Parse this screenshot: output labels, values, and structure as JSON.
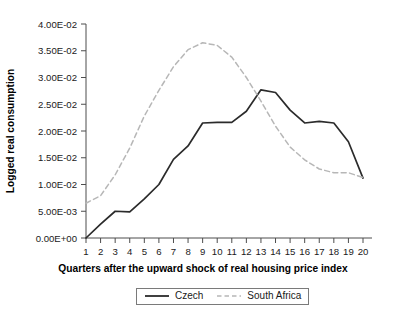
{
  "chart_data": {
    "type": "line",
    "title": "",
    "subtitle": "",
    "xlabel": "Quarters after the upward shock of real housing price index",
    "ylabel": "Logged real consumption",
    "x": [
      1,
      2,
      3,
      4,
      5,
      6,
      7,
      8,
      9,
      10,
      11,
      12,
      13,
      14,
      15,
      16,
      17,
      18,
      19,
      20
    ],
    "xtick_labels": [
      "1",
      "2",
      "3",
      "4",
      "5",
      "6",
      "7",
      "8",
      "9",
      "10",
      "11",
      "12",
      "13",
      "14",
      "15",
      "16",
      "17",
      "18",
      "19",
      "20"
    ],
    "ytick_labels": [
      "0.00E+00",
      "5.00E-03",
      "1.00E-02",
      "1.50E-02",
      "2.00E-02",
      "2.50E-02",
      "3.00E-02",
      "3.50E-02",
      "4.00E-02"
    ],
    "ytick_values": [
      0.0,
      0.005,
      0.01,
      0.015,
      0.02,
      0.025,
      0.03,
      0.035,
      0.04
    ],
    "ylim": [
      0.0,
      0.04
    ],
    "xlim": [
      1,
      20
    ],
    "grid": false,
    "legend_position": "bottom-center",
    "series": [
      {
        "name": "Czech",
        "color": "#2b2b2b",
        "style": "solid",
        "values": [
          0.0,
          0.0026,
          0.005,
          0.0049,
          0.0073,
          0.01,
          0.0147,
          0.0172,
          0.0215,
          0.0216,
          0.0216,
          0.0237,
          0.0277,
          0.0272,
          0.0239,
          0.0215,
          0.0218,
          0.0215,
          0.018,
          0.0112
        ]
      },
      {
        "name": "South Africa",
        "color": "#b7b7b7",
        "style": "dashed",
        "values": [
          0.0065,
          0.0079,
          0.0118,
          0.0168,
          0.0228,
          0.0276,
          0.032,
          0.0352,
          0.0365,
          0.036,
          0.0338,
          0.03,
          0.0256,
          0.0209,
          0.017,
          0.0146,
          0.0129,
          0.0122,
          0.0122,
          0.0113
        ]
      }
    ]
  },
  "legend": {
    "items": [
      {
        "label": "Czech",
        "swatch": "solid-line-swatch"
      },
      {
        "label": "South Africa",
        "swatch": "dashed-line-swatch"
      }
    ]
  }
}
